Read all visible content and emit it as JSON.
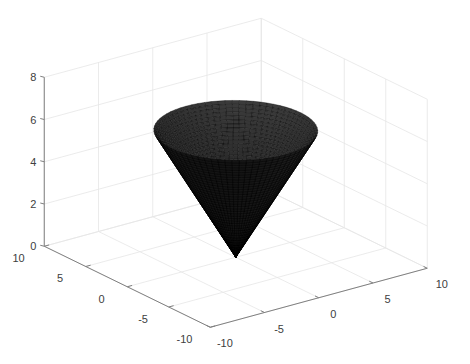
{
  "chart_data": {
    "type": "surface3d",
    "title": "",
    "xlabel": "",
    "ylabel": "",
    "zlabel": "",
    "surface": {
      "name": "cone",
      "equation": "z = sqrt(x^2 + y^2)",
      "r_range": [
        0,
        6
      ],
      "z_range": [
        0,
        6
      ],
      "face_color": "#000000",
      "edge_color": "#000000",
      "mesh_rings": 40,
      "mesh_segments": 72
    },
    "xlim": [
      -10,
      10
    ],
    "ylim": [
      -10,
      10
    ],
    "zlim": [
      0,
      8
    ],
    "xticks": [
      -10,
      -5,
      0,
      5,
      10
    ],
    "yticks": [
      -10,
      -5,
      0,
      5,
      10
    ],
    "zticks": [
      0,
      2,
      4,
      6,
      8
    ],
    "xtick_labels": [
      "-10",
      "-5",
      "0",
      "5",
      "10"
    ],
    "ytick_labels": [
      "-10",
      "-5",
      "0",
      "5",
      "10"
    ],
    "ztick_labels": [
      "0",
      "2",
      "4",
      "6",
      "8"
    ],
    "grid": true,
    "box": false,
    "view": "default-3d (az -37.5, el 30)"
  },
  "colors": {
    "background": "#ffffff",
    "grid": "#e6e6e6",
    "axis": "#808080",
    "tick_text": "#404040",
    "surface": "#000000"
  }
}
